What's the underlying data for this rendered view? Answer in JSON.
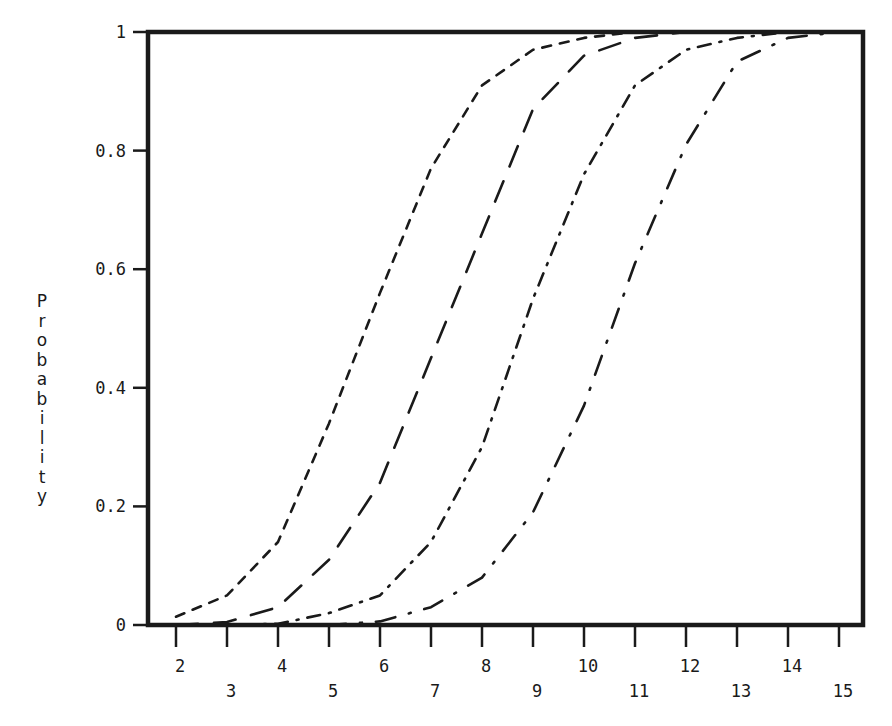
{
  "chart_data": {
    "type": "line",
    "title": "",
    "xlabel": "",
    "ylabel": "Probability",
    "xlim": [
      1.45,
      15.5
    ],
    "ylim": [
      0,
      1
    ],
    "grid": false,
    "legend": null,
    "x_ticks": [
      2,
      3,
      4,
      5,
      6,
      7,
      8,
      9,
      10,
      11,
      12,
      13,
      14,
      15
    ],
    "y_ticks": [
      0,
      0.2,
      0.4,
      0.6,
      0.8,
      1
    ],
    "y_tick_labels": [
      "0",
      "0.2",
      "0.4",
      "0.6",
      "0.8",
      "1"
    ],
    "series": [
      {
        "name": "curve-1 (short dashes)",
        "line_style": "short-dash",
        "x": [
          2,
          3,
          4,
          5,
          6,
          7,
          8,
          9,
          10,
          11,
          12,
          13,
          14,
          15
        ],
        "values": [
          0.014,
          0.05,
          0.14,
          0.34,
          0.56,
          0.77,
          0.91,
          0.97,
          0.99,
          1.0,
          1.0,
          1.0,
          1.0,
          1.0
        ]
      },
      {
        "name": "curve-2 (long dashes)",
        "line_style": "long-dash",
        "x": [
          2,
          3,
          4,
          5,
          6,
          7,
          8,
          9,
          10,
          11,
          12,
          13,
          14,
          15
        ],
        "values": [
          0.0,
          0.005,
          0.03,
          0.11,
          0.24,
          0.45,
          0.66,
          0.87,
          0.96,
          0.99,
          1.0,
          1.0,
          1.0,
          1.0
        ]
      },
      {
        "name": "curve-3 (dash-dot, short)",
        "line_style": "dash-dot-short",
        "x": [
          2,
          3,
          4,
          5,
          6,
          7,
          8,
          9,
          10,
          11,
          12,
          13,
          14,
          15
        ],
        "values": [
          0.0,
          0.0,
          0.002,
          0.02,
          0.05,
          0.14,
          0.3,
          0.55,
          0.76,
          0.91,
          0.97,
          0.99,
          1.0,
          1.0
        ]
      },
      {
        "name": "curve-4 (dash-dot, long)",
        "line_style": "dash-dot-long",
        "x": [
          2,
          3,
          4,
          5,
          6,
          7,
          8,
          9,
          10,
          11,
          12,
          13,
          14,
          15
        ],
        "values": [
          0.0,
          0.0,
          0.0,
          0.0,
          0.006,
          0.03,
          0.08,
          0.19,
          0.37,
          0.61,
          0.81,
          0.95,
          0.99,
          1.0
        ]
      }
    ]
  },
  "axes": {
    "ylabel_letters": [
      "P",
      "r",
      "o",
      "b",
      "a",
      "b",
      "i",
      "l",
      "i",
      "t",
      "y"
    ]
  }
}
